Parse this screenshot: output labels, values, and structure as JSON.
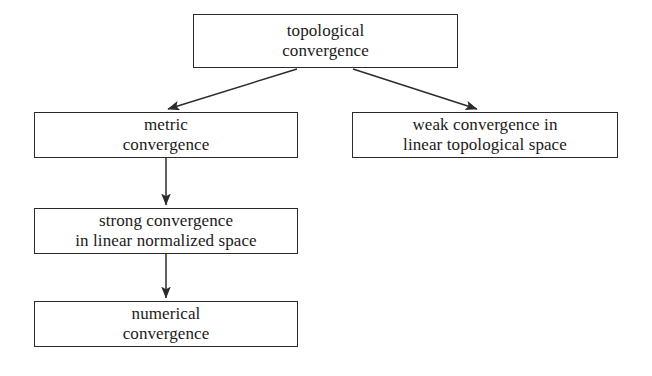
{
  "diagram": {
    "background_color": "#ffffff",
    "line_color": "#2b2b2b",
    "text_color": "#1a1a1a",
    "nodes": [
      {
        "id": "topological",
        "label": "topological\nconvergence"
      },
      {
        "id": "metric",
        "label": "metric\nconvergence"
      },
      {
        "id": "weak",
        "label": "weak convergence in\nlinear topological space"
      },
      {
        "id": "strong",
        "label": "strong convergence\nin linear normalized space"
      },
      {
        "id": "numerical",
        "label": "numerical\nconvergence"
      }
    ],
    "edges": [
      {
        "id": "edge-topological-metric",
        "from": "topological",
        "to": "metric",
        "style": "diagonal-arrow"
      },
      {
        "id": "edge-topological-weak",
        "from": "topological",
        "to": "weak",
        "style": "diagonal-arrow"
      },
      {
        "id": "edge-metric-strong",
        "from": "metric",
        "to": "strong",
        "style": "vertical-arrow"
      },
      {
        "id": "edge-strong-numerical",
        "from": "strong",
        "to": "numerical",
        "style": "vertical-arrow"
      }
    ]
  }
}
